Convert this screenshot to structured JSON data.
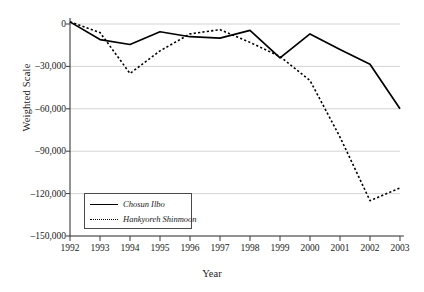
{
  "chart_data": {
    "type": "line",
    "title": "",
    "xlabel": "Year",
    "ylabel": "Weighted Scale",
    "categories": [
      "1992",
      "1993",
      "1994",
      "1995",
      "1996",
      "1997",
      "1998",
      "1999",
      "2000",
      "2001",
      "2002",
      "2003"
    ],
    "x": [
      1992,
      1993,
      1994,
      1995,
      1996,
      1997,
      1998,
      1999,
      2000,
      2001,
      2002,
      2003
    ],
    "xlim": [
      1992,
      2003
    ],
    "ylim": [
      -150000,
      0
    ],
    "yticks": [
      0,
      -30000,
      -60000,
      -90000,
      -120000,
      -150000
    ],
    "ytick_labels": [
      "0",
      "–30,000",
      "–60,000",
      "–90,000",
      "–120,000",
      "–150,000"
    ],
    "grid": "horizontal",
    "legend_position": "lower-left-inside",
    "series": [
      {
        "name": "Chosun Ilbo",
        "style": "solid",
        "color": "#000000",
        "values": [
          1500,
          -11000,
          -14500,
          -5500,
          -9000,
          -10000,
          -4500,
          -24000,
          -7000,
          -18000,
          -28500,
          -60000
        ]
      },
      {
        "name": "Hankyoreh Shinmoon",
        "style": "dotted",
        "color": "#000000",
        "values": [
          1500,
          -6000,
          -35000,
          -19000,
          -7000,
          -4000,
          -13000,
          -23000,
          -40000,
          -80000,
          -125000,
          -116000
        ]
      }
    ]
  },
  "axes": {
    "y_title": "Weighted Scale",
    "x_title": "Year"
  },
  "legend": {
    "entries": [
      {
        "label": "Chosun Ilbo",
        "style": "solid"
      },
      {
        "label": "Hankyoreh Shinmoon",
        "style": "dotted"
      }
    ]
  }
}
